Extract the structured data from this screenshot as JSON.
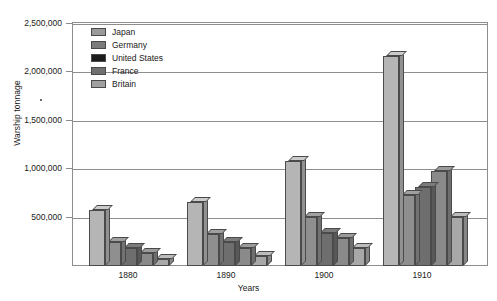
{
  "chart_data": {
    "type": "bar",
    "title": "",
    "xlabel": "Years",
    "ylabel": "Warship tonnage",
    "categories": [
      "1880",
      "1890",
      "1900",
      "1910"
    ],
    "ylim": [
      0,
      2500000
    ],
    "yticks": [
      500000,
      1000000,
      1500000,
      2000000,
      2500000
    ],
    "ytick_labels": [
      "500,000",
      "1,000,000",
      "1,500,000",
      "2,000,000",
      "2,500,000"
    ],
    "grid": true,
    "legend_position": "upper-left-inside",
    "series": [
      {
        "name": "Japan",
        "color": "#b5b5b5",
        "values": [
          580000,
          660000,
          1080000,
          2170000
        ]
      },
      {
        "name": "Germany",
        "color": "#8f8f8f",
        "values": [
          250000,
          330000,
          510000,
          730000
        ]
      },
      {
        "name": "United States",
        "color": "#6e6e6e",
        "values": [
          190000,
          250000,
          340000,
          820000
        ]
      },
      {
        "name": "France",
        "color": "#8a8a8a",
        "values": [
          130000,
          185000,
          290000,
          980000
        ]
      },
      {
        "name": "Britain",
        "color": "#a8a8a8",
        "values": [
          70000,
          100000,
          190000,
          510000
        ]
      }
    ],
    "legend_swatch_colors": [
      "#9a9a9a",
      "#7b7b7b",
      "#1c1c1c",
      "#707070",
      "#a0a0a0"
    ]
  }
}
